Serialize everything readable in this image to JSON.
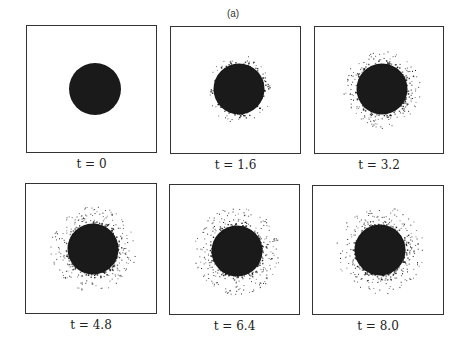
{
  "figure": {
    "label": "(a)",
    "ink_color": "#1a1a1a",
    "panels": [
      {
        "caption": "t = 0",
        "box": [
          26,
          25,
          131,
          128
        ],
        "center": [
          68,
          63
        ],
        "radius": 26,
        "spread": 0,
        "density": 0
      },
      {
        "caption": "t = 1.6",
        "box": [
          170,
          26,
          131,
          128
        ],
        "center": [
          68,
          62
        ],
        "radius": 27,
        "spread": 4,
        "density": 120
      },
      {
        "caption": "t = 3.2",
        "box": [
          314,
          26,
          130,
          128
        ],
        "center": [
          67,
          62
        ],
        "radius": 27,
        "spread": 9,
        "density": 260
      },
      {
        "caption": "t = 4.8",
        "box": [
          25,
          183,
          132,
          131
        ],
        "center": [
          67,
          65
        ],
        "radius": 27,
        "spread": 13,
        "density": 340
      },
      {
        "caption": "t = 6.4",
        "box": [
          169,
          184,
          131,
          131
        ],
        "center": [
          67,
          66
        ],
        "radius": 27,
        "spread": 14,
        "density": 360
      },
      {
        "caption": "t = 8.0",
        "box": [
          312,
          185,
          132,
          130
        ],
        "center": [
          67,
          64
        ],
        "radius": 27,
        "spread": 14,
        "density": 360
      }
    ]
  }
}
